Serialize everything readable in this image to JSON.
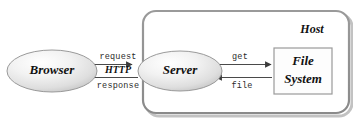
{
  "diagram": {
    "background_color": "#ffffff",
    "container": {
      "label": "Host",
      "border_color": "#8c8c8c",
      "fill_color": "#ffffff",
      "shadow_color": "#b8b8b8"
    },
    "nodes": [
      {
        "id": "browser",
        "label": "Browser",
        "shape": "ellipse",
        "fill_light": "#fbfbfb",
        "fill_dark": "#c9c9c9",
        "stroke_color": "#9a9a9a"
      },
      {
        "id": "server",
        "label": "Server",
        "shape": "ellipse",
        "fill_light": "#fbfbfb",
        "fill_dark": "#c9c9c9",
        "stroke_color": "#9a9a9a"
      },
      {
        "id": "file-system",
        "label_line1": "File",
        "label_line2": "System",
        "shape": "rectangle",
        "fill_color": "#fdfdfd",
        "stroke_color": "#9a9a9a"
      }
    ],
    "edges": [
      {
        "id": "browser-to-server",
        "label": "request",
        "label_style": "monospace",
        "from": "browser",
        "to": "server",
        "direction": "right",
        "color": "#4a4a4a"
      },
      {
        "id": "server-to-browser",
        "label": "response",
        "label_style": "monospace",
        "from": "server",
        "to": "browser",
        "direction": "left",
        "color": "#4a4a4a"
      },
      {
        "id": "http-protocol",
        "label": "HTTP",
        "label_style": "serif-bold-italic",
        "from": "browser",
        "to": "server",
        "direction": "none",
        "color": "#111111"
      },
      {
        "id": "server-to-filesystem",
        "label": "get",
        "label_style": "monospace",
        "from": "server",
        "to": "file-system",
        "direction": "right",
        "color": "#4a4a4a"
      },
      {
        "id": "filesystem-to-server",
        "label": "file",
        "label_style": "monospace",
        "from": "file-system",
        "to": "server",
        "direction": "left",
        "color": "#4a4a4a"
      }
    ]
  }
}
